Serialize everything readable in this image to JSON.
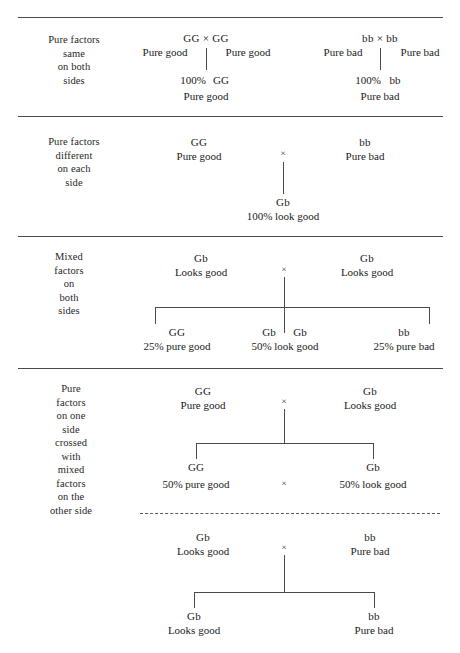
{
  "diagram": {
    "cross_symbol": "×",
    "sections": [
      {
        "id": "pure-same-both-sides",
        "side_label_lines": [
          "Pure factors",
          "same",
          "on both",
          "sides"
        ],
        "left_cross": {
          "head": "GG × GG",
          "parent_left": "Pure good",
          "parent_right": "Pure good",
          "offspring_percent": "100%",
          "offspring_geno": "GG",
          "offspring_pheno": "Pure good"
        },
        "right_cross": {
          "head": "bb × bb",
          "parent_left": "Pure bad",
          "parent_right": "Pure bad",
          "offspring_percent": "100%",
          "offspring_geno": "bb",
          "offspring_pheno": "Pure bad"
        }
      },
      {
        "id": "pure-different-each-side",
        "side_label_lines": [
          "Pure factors",
          "different",
          "on each",
          "side"
        ],
        "parent_left": {
          "geno": "GG",
          "pheno": "Pure good"
        },
        "parent_right": {
          "geno": "bb",
          "pheno": "Pure bad"
        },
        "offspring": [
          {
            "geno": "Gb",
            "pheno": "100% look good"
          }
        ]
      },
      {
        "id": "mixed-both-sides",
        "side_label_lines": [
          "Mixed",
          "factors",
          "on",
          "both",
          "sides"
        ],
        "parent_left": {
          "geno": "Gb",
          "pheno": "Looks good"
        },
        "parent_right": {
          "geno": "Gb",
          "pheno": "Looks good"
        },
        "offspring": [
          {
            "geno": "GG",
            "pheno": "25% pure good"
          },
          {
            "geno": "Gb",
            "geno2": "Gb",
            "pheno": "50% look good"
          },
          {
            "geno": "bb",
            "pheno": "25% pure bad"
          }
        ]
      },
      {
        "id": "pure-crossed-with-mixed",
        "side_label_lines": [
          "Pure",
          "factors",
          "on one",
          "side",
          "crossed",
          "with",
          "mixed",
          "factors",
          "on the",
          "other side"
        ],
        "cross_a": {
          "parent_left": {
            "geno": "GG",
            "pheno": "Pure good"
          },
          "parent_right": {
            "geno": "Gb",
            "pheno": "Looks good"
          },
          "offspring": [
            {
              "geno": "GG",
              "pheno": "50% pure good"
            },
            {
              "geno": "Gb",
              "pheno": "50% look good"
            }
          ]
        },
        "cross_b": {
          "parent_left": {
            "geno": "Gb",
            "pheno": "Looks good"
          },
          "parent_right": {
            "geno": "bb",
            "pheno": "Pure bad"
          },
          "offspring": [
            {
              "geno": "Gb",
              "pheno": "Looks good"
            },
            {
              "geno": "bb",
              "pheno": "Pure bad"
            }
          ]
        }
      }
    ]
  }
}
